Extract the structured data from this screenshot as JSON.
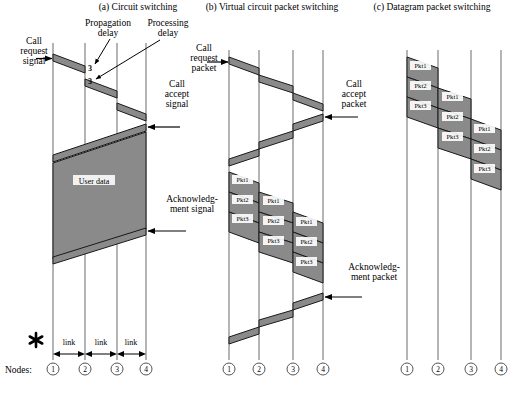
{
  "figure": {
    "nodes_word": "Nodes:",
    "link_label": "link",
    "star_marker": "asterisk-marker"
  },
  "panels": [
    {
      "id": "a",
      "title": "(a) Circuit switching",
      "nodes": [
        "1",
        "2",
        "3",
        "4"
      ],
      "links": [
        "link",
        "link",
        "link"
      ],
      "annotations": [
        {
          "name": "call-request-signal",
          "lines": [
            "Call",
            "request",
            "signal"
          ]
        },
        {
          "name": "propagation-delay",
          "lines": [
            "Propagation",
            "delay"
          ]
        },
        {
          "name": "processing-delay",
          "lines": [
            "Processing",
            "delay"
          ]
        },
        {
          "name": "call-accept-signal",
          "lines": [
            "Call",
            "accept",
            "signal"
          ]
        },
        {
          "name": "acknowledgment-signal",
          "lines": [
            "Acknowledg-",
            "ment signal"
          ]
        }
      ],
      "data_block_label": "User data",
      "delay_ticks": [
        "3",
        "3"
      ]
    },
    {
      "id": "b",
      "title": "(b) Virtual circuit packet switching",
      "nodes": [
        "1",
        "2",
        "3",
        "4"
      ],
      "annotations": [
        {
          "name": "call-request-packet",
          "lines": [
            "Call",
            "request",
            "packet"
          ]
        },
        {
          "name": "call-accept-packet",
          "lines": [
            "Call",
            "accept",
            "packet"
          ]
        },
        {
          "name": "acknowledgment-packet",
          "lines": [
            "Acknowledg-",
            "ment packet"
          ]
        }
      ],
      "packets": {
        "hop1": [
          "Pkt1",
          "Pkt2",
          "Pkt3"
        ],
        "hop2": [
          "Pkt1",
          "Pkt2",
          "Pkt3"
        ],
        "hop3": [
          "Pkt1",
          "Pkt2",
          "Pkt3"
        ]
      }
    },
    {
      "id": "c",
      "title": "(c) Datagram packet switching",
      "nodes": [
        "1",
        "2",
        "3",
        "4"
      ],
      "annotations": [],
      "packets": {
        "hop1": [
          "Pkt1",
          "Pkt2",
          "Pkt3"
        ],
        "hop2": [
          "Pkt1",
          "Pkt2",
          "Pkt3"
        ],
        "hop3": [
          "Pkt1",
          "Pkt2",
          "Pkt3"
        ]
      }
    }
  ],
  "colors": {
    "band_fill": "#8a8a8a",
    "band_stroke": "#1a1a1a",
    "timeline": "#8d8d8d",
    "text": "#000000",
    "background": "#ffffff"
  }
}
